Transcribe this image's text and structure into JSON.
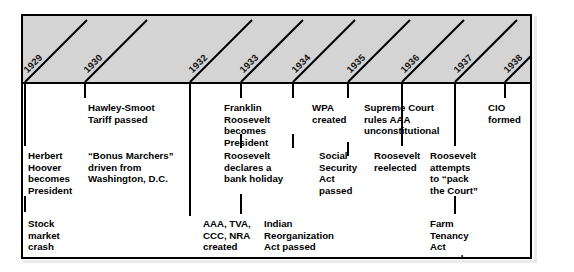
{
  "figure": {
    "type": "timeline",
    "orientation": "horizontal",
    "band_fill": "#d4d4d4",
    "line_color": "#000000",
    "background": "#ffffff"
  },
  "years": [
    {
      "label": "1929",
      "x": 23
    },
    {
      "label": "1930",
      "x": 83
    },
    {
      "label": "1932",
      "x": 188
    },
    {
      "label": "1933",
      "x": 239
    },
    {
      "label": "1934",
      "x": 291
    },
    {
      "label": "1935",
      "x": 346
    },
    {
      "label": "1936",
      "x": 400
    },
    {
      "label": "1937",
      "x": 453
    },
    {
      "label": "1938",
      "x": 503
    }
  ],
  "events": [
    {
      "id": "hawley-smoot",
      "year": "1930",
      "tick_x": 83,
      "text_x": 86,
      "row": 1,
      "lines": [
        "Hawley-Smoot",
        "Tariff passed"
      ]
    },
    {
      "id": "hoover-becomes-president",
      "year": "1929",
      "tick_x": 23,
      "text_x": 26,
      "row": 2,
      "lines": [
        "Herbert",
        "Hoover",
        "becomes",
        "President"
      ]
    },
    {
      "id": "stock-market-crash",
      "year": "1929",
      "tick_x": 23,
      "text_x": 26,
      "row": 3,
      "lines": [
        "Stock",
        "market",
        "crash"
      ]
    },
    {
      "id": "bonus-marchers",
      "year": "1932",
      "tick_x": 188,
      "text_x": 86,
      "row": 2,
      "lines": [
        "“Bonus Marchers”",
        "driven from",
        "Washington, D.C."
      ]
    },
    {
      "id": "franklin-roosevelt-becomes-president",
      "year": "1933",
      "tick_x": 239,
      "text_x": 222,
      "row": 1,
      "lines": [
        "Franklin",
        "Roosevelt",
        "becomes",
        "President"
      ]
    },
    {
      "id": "bank-holiday",
      "year": "1933",
      "tick_x": 239,
      "text_x": 222,
      "row": 2,
      "lines": [
        "Roosevelt",
        "declares a",
        "bank holiday"
      ]
    },
    {
      "id": "new-deal-agencies",
      "year": "1933",
      "tick_x": 239,
      "text_x": 201,
      "row": 3,
      "lines": [
        "AAA, TVA,",
        "CCC, NRA",
        "created"
      ]
    },
    {
      "id": "wpa-created",
      "year": "1934",
      "tick_x": 291,
      "text_x": 310,
      "row": 1,
      "lines": [
        "WPA",
        "created"
      ]
    },
    {
      "id": "social-security-act",
      "year": "1935",
      "tick_x": 346,
      "text_x": 317,
      "row": 2,
      "lines": [
        "Social",
        "Security",
        "Act",
        "passed"
      ]
    },
    {
      "id": "indian-reorganization-act",
      "year": "1934",
      "tick_x": 291,
      "text_x": 262,
      "row": 3,
      "lines": [
        "Indian",
        "Reorganization",
        "Act passed"
      ]
    },
    {
      "id": "supreme-court-rules-aaa",
      "year": "1935",
      "tick_x": 346,
      "text_x": 362,
      "row": 1,
      "lines": [
        "Supreme Court",
        "rules AAA",
        "unconstitutional"
      ]
    },
    {
      "id": "roosevelt-reelected",
      "year": "1936",
      "tick_x": 400,
      "text_x": 372,
      "row": 2,
      "lines": [
        "Roosevelt",
        "reelected"
      ]
    },
    {
      "id": "pack-the-court",
      "year": "1937",
      "tick_x": 453,
      "text_x": 428,
      "row": 2,
      "lines": [
        "Roosevelt",
        "attempts",
        "to “pack",
        "the Court”"
      ]
    },
    {
      "id": "farm-tenancy-act",
      "year": "1937",
      "tick_x": 453,
      "text_x": 428,
      "row": 3,
      "lines": [
        "Farm",
        "Tenancy",
        "Act",
        "passed"
      ]
    },
    {
      "id": "cio-formed",
      "year": "1938",
      "tick_x": 503,
      "text_x": 486,
      "row": 1,
      "lines": [
        "CIO",
        "formed"
      ]
    }
  ]
}
